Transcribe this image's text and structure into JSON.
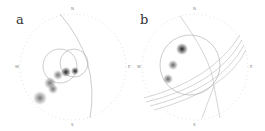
{
  "figure": {
    "panels": [
      {
        "label": "a",
        "compass": {
          "n": "N",
          "s": "S",
          "e": "E",
          "w": "W"
        }
      },
      {
        "label": "b",
        "compass": {
          "n": "N",
          "s": "S",
          "e": "E",
          "w": "W"
        }
      }
    ],
    "colors": {
      "outline": "#bbbbbb",
      "curve": "#999999",
      "cluster": "#555555"
    }
  }
}
